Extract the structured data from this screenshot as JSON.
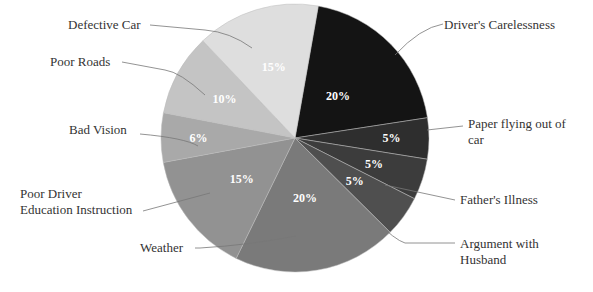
{
  "chart_data": {
    "type": "pie",
    "title": "",
    "categories": [
      "Driver's Carelessness",
      "Paper flying out of car",
      "Father's Illness",
      "Argument with Husband",
      "Weather",
      "Poor Driver Education Instruction",
      "Bad Vision",
      "Poor Roads",
      "Defective Car"
    ],
    "values": [
      20,
      5,
      5,
      5,
      20,
      15,
      6,
      10,
      15
    ],
    "value_labels": [
      "20%",
      "5%",
      "5%",
      "5%",
      "20%",
      "15%",
      "6%",
      "10%",
      "15%"
    ],
    "value_total": 101,
    "note": "Slice labels as shown sum to 101%, not 100%. Values are transcribed exactly as printed.",
    "colors": [
      "#141414",
      "#2e2e2e",
      "#3c3c3c",
      "#4f4f4f",
      "#7a7a7a",
      "#929292",
      "#a9a9a9",
      "#c4c4c4",
      "#dedede"
    ],
    "start_angle_deg": 10,
    "direction": "clockwise",
    "legend_position": "none (leader-line labels)",
    "grid": false
  },
  "labels": {
    "drivers_carelessness": "Driver's Carelessness",
    "paper_line1": "Paper flying out of",
    "paper_line2": "car",
    "fathers_illness": "Father's Illness",
    "argument_line1": "Argument with",
    "argument_line2": "Husband",
    "weather": "Weather",
    "poor_driver_line1": "Poor Driver",
    "poor_driver_line2": "Education Instruction",
    "bad_vision": "Bad Vision",
    "poor_roads": "Poor Roads",
    "defective_car": "Defective Car"
  }
}
